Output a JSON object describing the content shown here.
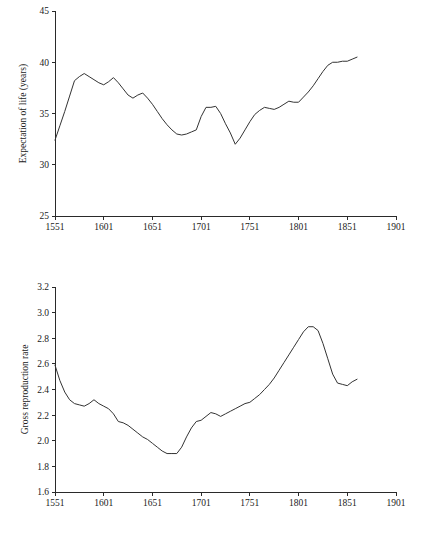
{
  "page": {
    "background": "#ffffff",
    "line_color": "#333333",
    "axis_color": "#2a2a2a",
    "figure_count": 2
  },
  "chart_data": [
    {
      "id": "expectation-of-life",
      "type": "line",
      "title": "",
      "subtitle": "",
      "xlabel": "",
      "ylabel": "Expectation of life (years)",
      "xlim": [
        1551,
        1901
      ],
      "ylim": [
        25,
        45
      ],
      "xticks": [
        1551,
        1601,
        1651,
        1701,
        1751,
        1801,
        1851,
        1901
      ],
      "xtick_labels": [
        "1551",
        "1601",
        "1651",
        "1701",
        "1751",
        "1801",
        "1851",
        "1901"
      ],
      "yticks": [
        25,
        30,
        35,
        40,
        45
      ],
      "ytick_labels": [
        "25",
        "30",
        "35",
        "40",
        "45"
      ],
      "grid": false,
      "legend": "none",
      "x": [
        1551,
        1556,
        1561,
        1566,
        1571,
        1576,
        1581,
        1586,
        1591,
        1596,
        1601,
        1606,
        1611,
        1616,
        1621,
        1626,
        1631,
        1636,
        1641,
        1646,
        1651,
        1656,
        1661,
        1666,
        1671,
        1676,
        1681,
        1686,
        1691,
        1696,
        1701,
        1706,
        1711,
        1716,
        1721,
        1726,
        1731,
        1736,
        1741,
        1746,
        1751,
        1756,
        1761,
        1766,
        1771,
        1776,
        1781,
        1786,
        1791,
        1796,
        1801,
        1806,
        1811,
        1816,
        1821,
        1826,
        1831,
        1836,
        1841,
        1846,
        1851,
        1856,
        1861
      ],
      "y": [
        32.4,
        33.8,
        35.2,
        36.7,
        38.2,
        38.6,
        38.9,
        38.6,
        38.3,
        38.0,
        37.8,
        38.1,
        38.5,
        38.0,
        37.4,
        36.8,
        36.5,
        36.8,
        37.0,
        36.5,
        35.9,
        35.2,
        34.5,
        33.9,
        33.4,
        33.0,
        32.9,
        33.0,
        33.2,
        33.4,
        34.7,
        35.6,
        35.6,
        35.7,
        35.0,
        34.0,
        33.1,
        32.0,
        32.6,
        33.4,
        34.2,
        34.9,
        35.3,
        35.6,
        35.5,
        35.4,
        35.6,
        35.9,
        36.2,
        36.1,
        36.1,
        36.6,
        37.1,
        37.7,
        38.4,
        39.1,
        39.7,
        40.0,
        40.0,
        40.1,
        40.1,
        40.3,
        40.5
      ],
      "series": [
        {
          "name": "Expectation of life (years)",
          "values": [
            32.4,
            33.8,
            35.2,
            36.7,
            38.2,
            38.6,
            38.9,
            38.6,
            38.3,
            38.0,
            37.8,
            38.1,
            38.5,
            38.0,
            37.4,
            36.8,
            36.5,
            36.8,
            37.0,
            36.5,
            35.9,
            35.2,
            34.5,
            33.9,
            33.4,
            33.0,
            32.9,
            33.0,
            33.2,
            33.4,
            34.7,
            35.6,
            35.6,
            35.7,
            35.0,
            34.0,
            33.1,
            32.0,
            32.6,
            33.4,
            34.2,
            34.9,
            35.3,
            35.6,
            35.5,
            35.4,
            35.6,
            35.9,
            36.2,
            36.1,
            36.1,
            36.6,
            37.1,
            37.7,
            38.4,
            39.1,
            39.7,
            40.0,
            40.0,
            40.1,
            40.1,
            40.3,
            40.5
          ]
        }
      ]
    },
    {
      "id": "gross-reproduction-rate",
      "type": "line",
      "title": "",
      "subtitle": "",
      "xlabel": "",
      "ylabel": "Gross reproduction rate",
      "xlim": [
        1551,
        1901
      ],
      "ylim": [
        1.6,
        3.2
      ],
      "xticks": [
        1551,
        1601,
        1651,
        1701,
        1751,
        1801,
        1851,
        1901
      ],
      "xtick_labels": [
        "1551",
        "1601",
        "1651",
        "1701",
        "1751",
        "1801",
        "1851",
        "1901"
      ],
      "yticks": [
        1.6,
        1.8,
        2.0,
        2.2,
        2.4,
        2.6,
        2.8,
        3.0,
        3.2
      ],
      "ytick_labels": [
        "1.6",
        "1.8",
        "2.0",
        "2.2",
        "2.4",
        "2.6",
        "2.8",
        "3.0",
        "3.2"
      ],
      "grid": false,
      "legend": "none",
      "x": [
        1551,
        1556,
        1561,
        1566,
        1571,
        1576,
        1581,
        1586,
        1591,
        1596,
        1601,
        1606,
        1611,
        1616,
        1621,
        1626,
        1631,
        1636,
        1641,
        1646,
        1651,
        1656,
        1661,
        1666,
        1671,
        1676,
        1681,
        1686,
        1691,
        1696,
        1701,
        1706,
        1711,
        1716,
        1721,
        1726,
        1731,
        1736,
        1741,
        1746,
        1751,
        1756,
        1761,
        1766,
        1771,
        1776,
        1781,
        1786,
        1791,
        1796,
        1801,
        1806,
        1811,
        1816,
        1821,
        1826,
        1831,
        1836,
        1841,
        1846,
        1851,
        1856,
        1861
      ],
      "y": [
        2.59,
        2.47,
        2.38,
        2.32,
        2.29,
        2.28,
        2.27,
        2.29,
        2.32,
        2.29,
        2.27,
        2.25,
        2.21,
        2.15,
        2.14,
        2.12,
        2.09,
        2.06,
        2.03,
        2.01,
        1.98,
        1.95,
        1.92,
        1.9,
        1.9,
        1.9,
        1.95,
        2.03,
        2.1,
        2.15,
        2.16,
        2.19,
        2.22,
        2.21,
        2.19,
        2.21,
        2.23,
        2.25,
        2.27,
        2.29,
        2.3,
        2.33,
        2.36,
        2.4,
        2.44,
        2.49,
        2.55,
        2.61,
        2.67,
        2.73,
        2.79,
        2.85,
        2.89,
        2.89,
        2.86,
        2.76,
        2.64,
        2.52,
        2.45,
        2.44,
        2.43,
        2.46,
        2.48
      ],
      "series": [
        {
          "name": "Gross reproduction rate",
          "values": [
            2.59,
            2.47,
            2.38,
            2.32,
            2.29,
            2.28,
            2.27,
            2.29,
            2.32,
            2.29,
            2.27,
            2.25,
            2.21,
            2.15,
            2.14,
            2.12,
            2.09,
            2.06,
            2.03,
            2.01,
            1.98,
            1.95,
            1.92,
            1.9,
            1.9,
            1.9,
            1.95,
            2.03,
            2.1,
            2.15,
            2.16,
            2.19,
            2.22,
            2.21,
            2.19,
            2.21,
            2.23,
            2.25,
            2.27,
            2.29,
            2.3,
            2.33,
            2.36,
            2.4,
            2.44,
            2.49,
            2.55,
            2.61,
            2.67,
            2.73,
            2.79,
            2.85,
            2.89,
            2.89,
            2.86,
            2.76,
            2.64,
            2.52,
            2.45,
            2.44,
            2.43,
            2.46,
            2.48
          ]
        }
      ]
    }
  ]
}
